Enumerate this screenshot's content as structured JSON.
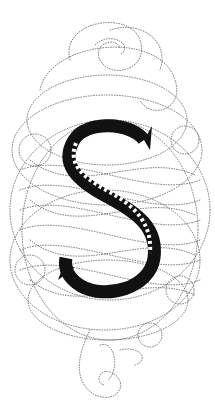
{
  "illustration": {
    "subject": "Ornamental dotted calligraphic flourish surrounding a decorated capital letter",
    "letter": "S",
    "colors": {
      "background": "#ffffff",
      "ink": "#111111",
      "dotted_lines": "#6a6a6a"
    }
  }
}
